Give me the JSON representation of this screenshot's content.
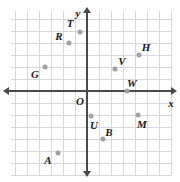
{
  "figure": {
    "type": "coordinate-plane",
    "axis_labels": {
      "x": "x",
      "y": "y",
      "origin": "O"
    },
    "grid": {
      "spacing_px": 12,
      "x_left_px": 11,
      "x_right_px": 171,
      "y_top_px": 11,
      "y_bottom_px": 175,
      "color": "#d8d8dc",
      "axis_color": "#4a4a4a"
    },
    "axes": {
      "x_axis_y_px": 91,
      "y_axis_x_px": 87,
      "x_min": -6.3,
      "x_max": 7.0,
      "y_min": -7.0,
      "y_max": 6.7
    }
  },
  "chart_data": {
    "type": "scatter",
    "title": "",
    "xlabel": "x",
    "ylabel": "y",
    "grid": true,
    "legend": "none",
    "xlim": [
      -6.3,
      7.0
    ],
    "ylim": [
      -7.0,
      6.7
    ],
    "point_color": "#a0a0a5",
    "points": [
      {
        "label": "T",
        "x": -0.6,
        "y": 4.9,
        "px": 80,
        "py": 32,
        "lx": 70,
        "ly": 23
      },
      {
        "label": "R",
        "x": -1.5,
        "y": 4.0,
        "px": 69,
        "py": 43,
        "lx": 59,
        "ly": 36
      },
      {
        "label": "H",
        "x": 4.3,
        "y": 3.0,
        "px": 139,
        "py": 55,
        "lx": 146,
        "ly": 47
      },
      {
        "label": "V",
        "x": 2.3,
        "y": 1.8,
        "px": 115,
        "py": 69,
        "lx": 122,
        "ly": 61
      },
      {
        "label": "G",
        "x": -3.5,
        "y": 2.0,
        "px": 45,
        "py": 67,
        "lx": 35,
        "ly": 74
      },
      {
        "label": "W",
        "x": 3.3,
        "y": 0.0,
        "px": 127,
        "py": 91,
        "lx": 132,
        "ly": 83
      },
      {
        "label": "U",
        "x": 0.3,
        "y": -2.1,
        "px": 91,
        "py": 116,
        "lx": 94,
        "ly": 125
      },
      {
        "label": "M",
        "x": 4.2,
        "y": -2.0,
        "px": 138,
        "py": 115,
        "lx": 142,
        "ly": 124
      },
      {
        "label": "B",
        "x": 1.3,
        "y": -4.0,
        "px": 103,
        "py": 139,
        "lx": 109,
        "ly": 132
      },
      {
        "label": "A",
        "x": -2.4,
        "y": -5.2,
        "px": 58,
        "py": 153,
        "lx": 48,
        "ly": 160
      }
    ]
  }
}
